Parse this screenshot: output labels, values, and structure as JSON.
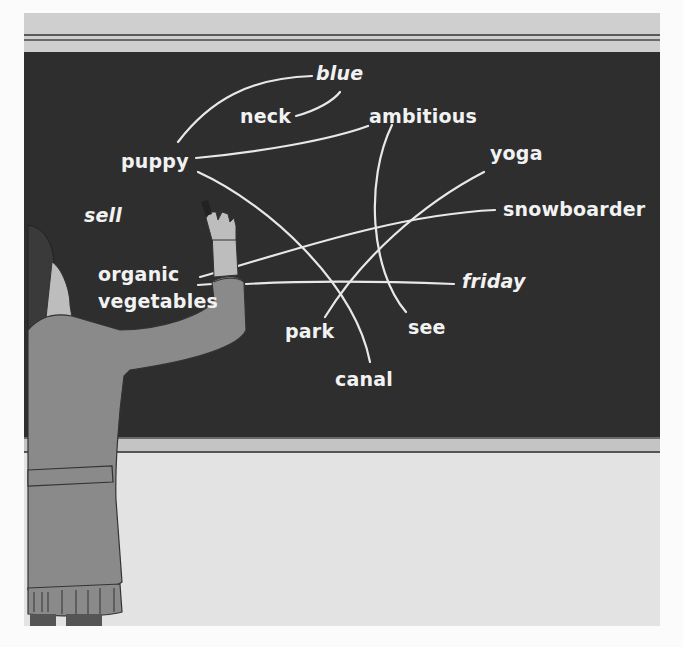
{
  "scene": {
    "description": "Person writing on a chalkboard with words connected by chalk lines",
    "colors": {
      "board": "#2e2e2e",
      "chalk": "#f2f2f2",
      "frame": "#cfcfcf",
      "wall": "#e3e3e3",
      "sweater": "#8a8a8a",
      "hair": "#3a3a3a",
      "skin": "#bdbdbd"
    }
  },
  "board": {
    "words": {
      "blue": "blue",
      "neck": "neck",
      "ambitious": "ambitious",
      "puppy": "puppy",
      "yoga": "yoga",
      "sell": "sell",
      "snowboarder": "snowboarder",
      "organic": "organic",
      "vegetables": "vegetables",
      "friday": "friday",
      "park": "park",
      "see": "see",
      "canal": "canal"
    },
    "connections": [
      {
        "from": "puppy",
        "to": "blue"
      },
      {
        "from": "neck",
        "to": "blue"
      },
      {
        "from": "puppy",
        "to": "ambitious"
      },
      {
        "from": "puppy",
        "to": "canal"
      },
      {
        "from": "ambitious",
        "to": "see"
      },
      {
        "from": "yoga",
        "to": "park"
      },
      {
        "from": "organic vegetables",
        "to": "snowboarder"
      },
      {
        "from": "organic vegetables",
        "to": "friday"
      }
    ]
  }
}
